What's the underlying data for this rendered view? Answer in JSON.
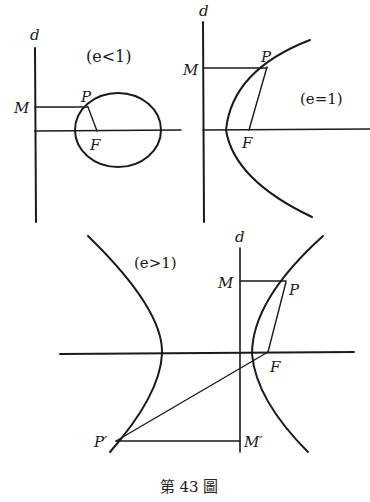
{
  "figure": {
    "caption": "第 43 圖",
    "colors": {
      "ink": "#1a1a1a",
      "background": "#ffffff"
    }
  },
  "panels": [
    {
      "id": "ellipse",
      "condition": "(e<1)",
      "labels": {
        "directrix": "d",
        "M": "M",
        "P": "P",
        "F": "F"
      }
    },
    {
      "id": "parabola",
      "condition": "(e=1)",
      "labels": {
        "directrix": "d",
        "M": "M",
        "P": "P",
        "F": "F"
      }
    },
    {
      "id": "hyperbola",
      "condition": "(e>1)",
      "labels": {
        "directrix": "d",
        "M": "M",
        "P": "P",
        "F": "F",
        "P_prime": "P′",
        "M_prime": "M′"
      }
    }
  ]
}
